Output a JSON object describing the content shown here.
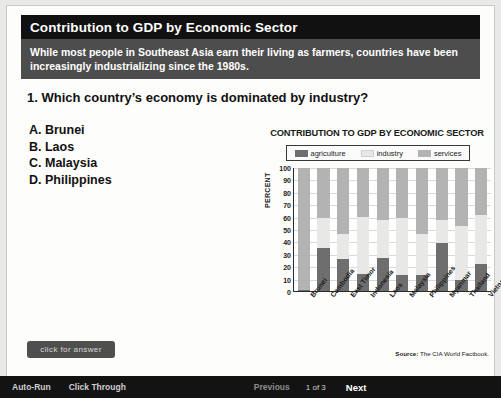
{
  "slide": {
    "title": "Contribution to GDP by Economic Sector",
    "subtitle": "While most people in Southeast Asia earn their living as farmers, countries have been increasingly industrializing since the 1980s.",
    "question": "1. Which country’s economy is dominated by industry?",
    "choices": [
      "A. Brunei",
      "B. Laos",
      "C. Malaysia",
      "D. Philippines"
    ],
    "answer_button": "click for answer"
  },
  "toolbar": {
    "auto_run": "Auto-Run",
    "click_through": "Click Through",
    "previous": "Previous",
    "page_indicator": "1 of 3",
    "next": "Next"
  },
  "source": {
    "label": "Source:",
    "text": "The CIA World Factbook."
  },
  "colors": {
    "agriculture": "#6e6e6e",
    "industry": "#e8e8e6",
    "services": "#b3b3b3",
    "title_bar": "#111111",
    "sub_bar": "#4d4d4d"
  },
  "chart_data": {
    "type": "bar",
    "stacked": true,
    "title": "CONTRIBUTION TO GDP BY ECONOMIC SECTOR",
    "xlabel": "",
    "ylabel": "PERCENT",
    "ylim": [
      0,
      100
    ],
    "yticks": [
      0,
      10,
      20,
      30,
      40,
      50,
      60,
      70,
      80,
      90,
      100
    ],
    "grid": true,
    "legend_position": "top",
    "categories": [
      "Brunei",
      "Cambodia",
      "East Timor",
      "Indonesia",
      "Laos",
      "Malaysia",
      "Philippines",
      "Myanmar",
      "Thailand",
      "Vietnam"
    ],
    "series": [
      {
        "name": "agriculture",
        "color": "#6e6e6e",
        "values": [
          1,
          35,
          26,
          14,
          27,
          13,
          13,
          39,
          9,
          22
        ]
      },
      {
        "name": "industry",
        "color": "#e8e8e6",
        "values": [
          0,
          24,
          20,
          46,
          31,
          46,
          33,
          19,
          44,
          40
        ]
      },
      {
        "name": "services",
        "color": "#b3b3b3",
        "values": [
          99,
          41,
          54,
          40,
          42,
          41,
          54,
          42,
          47,
          38
        ]
      }
    ]
  }
}
